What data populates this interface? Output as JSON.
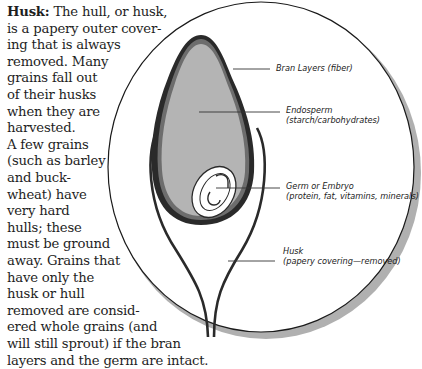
{
  "text": {
    "heading": "Husk:",
    "lines": [
      " The hull, or husk,",
      "is a papery outer cover-",
      "ing that is always",
      "removed. Many",
      "grains fall out",
      "of their husks",
      "when they are",
      "harvested.",
      "A few grains",
      "(such as barley",
      "and buck-",
      "wheat) have",
      "very hard",
      "hulls; these",
      "must be ground",
      "away. Grains that",
      "have only the",
      "husk or hull",
      "removed are consid-",
      "ered whole grains (and",
      "will still sprout) if the bran",
      "layers and the germ are intact."
    ]
  },
  "diagram": {
    "labels": {
      "bran": {
        "title": "Bran Layers (fiber)"
      },
      "endosperm": {
        "title": "Endosperm",
        "subtitle": "(starch/carbohydrates)"
      },
      "germ": {
        "title": "Germ or Embryo",
        "subtitle": "(protein, fat, vitamins, minerals)"
      },
      "husk": {
        "title": "Husk",
        "subtitle": "(papery covering—removed)"
      }
    },
    "colors": {
      "endosperm_fill": "#b4b4b4",
      "bran_outline": "#2a2a2a",
      "circle_stroke": "#1a1a1a",
      "shadow": "#b0b0b0",
      "germ_fill": "#ffffff"
    }
  }
}
